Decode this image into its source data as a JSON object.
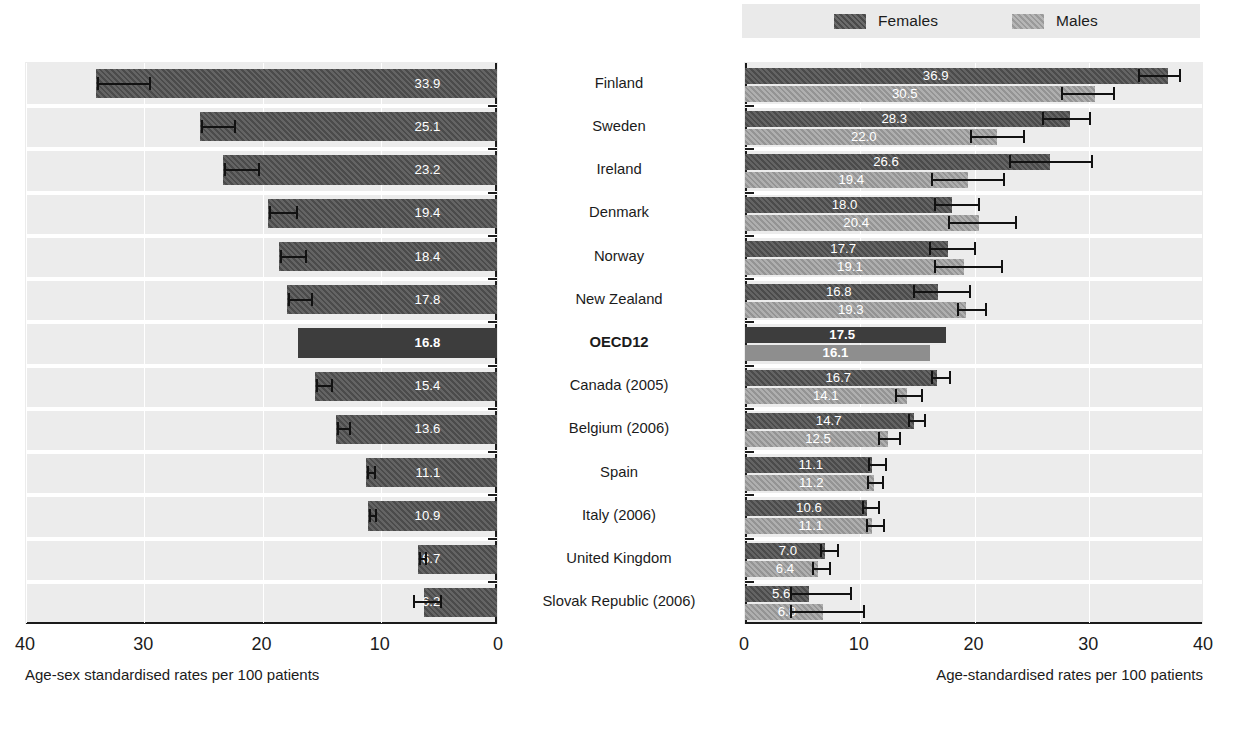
{
  "legend": {
    "entries": [
      {
        "label": "Females",
        "icon": "females-swatch",
        "color": "#4b4b4b"
      },
      {
        "label": "Males",
        "icon": "males-swatch",
        "color": "#949494"
      }
    ]
  },
  "left_axis": {
    "title": "Age-sex standardised rates per 100 patients",
    "ticks": [
      "40",
      "30",
      "20",
      "10",
      "0"
    ]
  },
  "right_axis": {
    "title": "Age-standardised rates per 100 patients",
    "ticks": [
      "0",
      "10",
      "20",
      "30",
      "40"
    ]
  },
  "countries": [
    {
      "label": "Finland",
      "highlight": false
    },
    {
      "label": "Sweden",
      "highlight": false
    },
    {
      "label": "Ireland",
      "highlight": false
    },
    {
      "label": "Denmark",
      "highlight": false
    },
    {
      "label": "Norway",
      "highlight": false
    },
    {
      "label": "New Zealand",
      "highlight": false
    },
    {
      "label": "OECD12",
      "highlight": true
    },
    {
      "label": "Canada (2005)",
      "highlight": false
    },
    {
      "label": "Belgium (2006)",
      "highlight": false
    },
    {
      "label": "Spain",
      "highlight": false
    },
    {
      "label": "Italy (2006)",
      "highlight": false
    },
    {
      "label": "United Kingdom",
      "highlight": false
    },
    {
      "label": "Slovak Republic (2006)",
      "highlight": false
    }
  ],
  "chart_data": [
    {
      "id": "total",
      "type": "bar",
      "orientation": "horizontal-reversed",
      "title": "",
      "xlabel": "Age-sex standardised rates per 100 patients",
      "ylabel": "",
      "xlim": [
        0,
        40
      ],
      "xticks": [
        40,
        30,
        20,
        10,
        0
      ],
      "grid": true,
      "categories": [
        "Finland",
        "Sweden",
        "Ireland",
        "Denmark",
        "Norway",
        "New Zealand",
        "OECD12",
        "Canada (2005)",
        "Belgium (2006)",
        "Spain",
        "Italy (2006)",
        "United Kingdom",
        "Slovak Republic (2006)"
      ],
      "values": [
        33.9,
        25.1,
        23.2,
        19.4,
        18.4,
        17.8,
        16.8,
        15.4,
        13.6,
        11.1,
        10.9,
        6.7,
        6.2
      ],
      "value_labels": [
        "33.9",
        "25.1",
        "23.2",
        "19.4",
        "18.4",
        "17.8",
        "16.8",
        "15.4",
        "13.6",
        "11.1",
        "10.9",
        "6.7",
        "6.2"
      ],
      "error_low": [
        29.5,
        22.3,
        20.3,
        17.1,
        16.3,
        15.8,
        null,
        14.1,
        12.6,
        10.5,
        10.4,
        6.2,
        4.9
      ],
      "error_high": [
        33.9,
        25.1,
        23.2,
        19.4,
        18.4,
        17.8,
        null,
        15.4,
        13.6,
        11.1,
        10.9,
        6.7,
        7.2
      ]
    },
    {
      "id": "by-sex",
      "type": "bar",
      "orientation": "horizontal",
      "title": "",
      "xlabel": "Age-standardised rates per 100 patients",
      "ylabel": "",
      "xlim": [
        0,
        40
      ],
      "xticks": [
        0,
        10,
        20,
        30,
        40
      ],
      "grid": true,
      "legend_position": "top-right",
      "categories": [
        "Finland",
        "Sweden",
        "Ireland",
        "Denmark",
        "Norway",
        "New Zealand",
        "OECD12",
        "Canada (2005)",
        "Belgium (2006)",
        "Spain",
        "Italy (2006)",
        "United Kingdom",
        "Slovak Republic (2006)"
      ],
      "series": [
        {
          "name": "Females",
          "color": "#4b4b4b",
          "values": [
            36.9,
            28.3,
            26.6,
            18.0,
            17.7,
            16.8,
            17.5,
            16.7,
            14.7,
            11.1,
            10.6,
            7.0,
            5.6
          ],
          "value_labels": [
            "36.9",
            "28.3",
            "26.6",
            "18.0",
            "17.7",
            "16.8",
            "17.5",
            "16.7",
            "14.7",
            "11.1",
            "10.6",
            "7.0",
            "5.6"
          ],
          "error_low": [
            34.3,
            26.0,
            23.1,
            16.6,
            16.1,
            14.7,
            null,
            16.3,
            14.3,
            10.8,
            10.3,
            6.6,
            4.0
          ],
          "error_high": [
            37.9,
            30.1,
            30.2,
            20.4,
            20.0,
            19.6,
            null,
            17.9,
            15.7,
            12.3,
            11.7,
            8.1,
            9.2
          ]
        },
        {
          "name": "Males",
          "color": "#949494",
          "values": [
            30.5,
            22.0,
            19.4,
            20.4,
            19.1,
            19.3,
            16.1,
            14.1,
            12.5,
            11.2,
            11.1,
            6.4,
            6.8
          ],
          "value_labels": [
            "30.5",
            "22.0",
            "19.4",
            "20.4",
            "19.1",
            "19.3",
            "16.1",
            "14.1",
            "12.5",
            "11.2",
            "11.1",
            "6.4",
            "6.8"
          ],
          "error_low": [
            27.6,
            19.7,
            16.3,
            17.8,
            16.6,
            18.6,
            null,
            13.2,
            11.7,
            10.7,
            10.6,
            5.9,
            4.0
          ],
          "error_high": [
            32.2,
            24.3,
            22.6,
            23.6,
            22.4,
            21.0,
            null,
            15.4,
            13.5,
            12.0,
            12.1,
            7.4,
            10.4
          ]
        }
      ]
    }
  ]
}
